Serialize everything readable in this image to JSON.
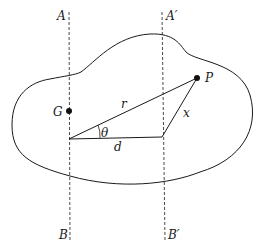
{
  "diagram": {
    "axes": [
      {
        "top_label": "A",
        "bottom_label": "B",
        "x": 69
      },
      {
        "top_label": "A′",
        "bottom_label": "B′",
        "x": 162
      }
    ],
    "points": [
      {
        "name": "G",
        "x": 69,
        "y": 111
      },
      {
        "name": "P",
        "x": 197,
        "y": 78
      }
    ],
    "segments": [
      {
        "name": "r",
        "label": "r",
        "from": [
          69,
          139
        ],
        "to": [
          197,
          78
        ]
      },
      {
        "name": "d",
        "label": "d",
        "from": [
          69,
          139
        ],
        "to": [
          162,
          139
        ]
      },
      {
        "name": "x",
        "label": "x",
        "from": [
          162,
          139
        ],
        "to": [
          197,
          78
        ]
      }
    ],
    "angle": {
      "label": "θ"
    },
    "colors": {
      "stroke": "#1a1a1a",
      "background": "#ffffff"
    }
  }
}
